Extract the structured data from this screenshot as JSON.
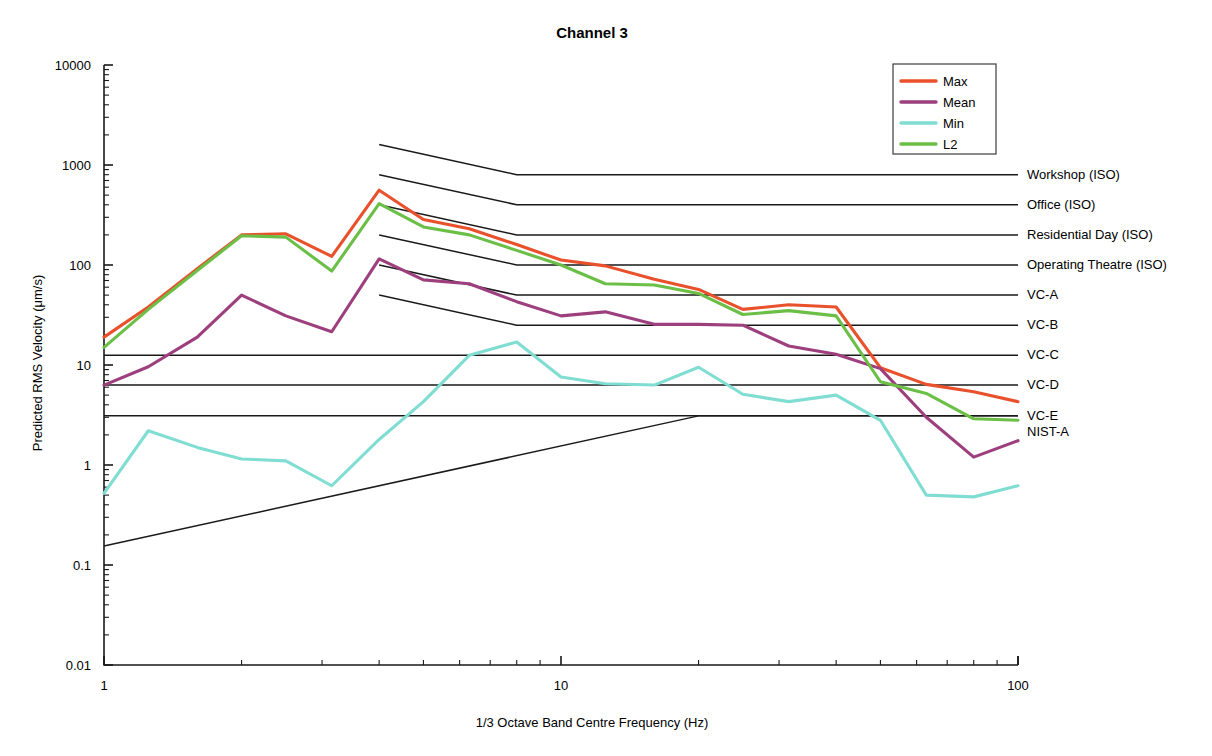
{
  "chart_data": {
    "type": "line",
    "title": "Channel 3",
    "xlabel": "1/3 Octave Band Centre Frequency (Hz)",
    "ylabel": "Predicted RMS Velocity (μm/s)",
    "xscale": "log",
    "yscale": "log",
    "xlim": [
      1,
      100
    ],
    "ylim": [
      0.01,
      10000
    ],
    "xticks": [
      1,
      10,
      100
    ],
    "xtick_labels": [
      "1",
      "10",
      "100"
    ],
    "yticks": [
      0.01,
      0.1,
      1,
      10,
      100,
      1000,
      10000
    ],
    "ytick_labels": [
      "0.01",
      "0.1",
      "1",
      "10",
      "100",
      "1000",
      "10000"
    ],
    "grid": false,
    "legend_position": "top-right",
    "x": [
      1.0,
      1.25,
      1.6,
      2.0,
      2.5,
      3.15,
      4.0,
      5.0,
      6.3,
      8.0,
      10.0,
      12.5,
      16.0,
      20.0,
      25.0,
      31.5,
      40.0,
      50.0,
      63.0,
      80.0,
      100.0
    ],
    "series": [
      {
        "name": "Max",
        "color": "#e8512c",
        "values": [
          19.0,
          38.0,
          92.0,
          200.0,
          205.0,
          122.0,
          560.0,
          285.0,
          230.0,
          160.0,
          112.0,
          98.0,
          72.0,
          57.0,
          36.0,
          40.0,
          38.0,
          9.4,
          6.4,
          5.4,
          4.3
        ]
      },
      {
        "name": "Mean",
        "color": "#9c3f7c",
        "values": [
          6.3,
          9.6,
          19.0,
          50.0,
          31.0,
          21.5,
          115.0,
          71.0,
          65.0,
          43.0,
          31.0,
          34.0,
          25.5,
          25.5,
          25.0,
          15.5,
          12.8,
          9.2,
          3.0,
          1.2,
          1.75
        ]
      },
      {
        "name": "Min",
        "color": "#80ddd2",
        "values": [
          0.52,
          2.2,
          1.5,
          1.15,
          1.1,
          0.62,
          1.8,
          4.3,
          12.5,
          17.0,
          7.6,
          6.5,
          6.3,
          9.5,
          5.1,
          4.3,
          5.0,
          2.8,
          0.5,
          0.48,
          0.62
        ]
      },
      {
        "name": "L2",
        "color": "#6bbf46",
        "values": [
          15.0,
          36.0,
          88.0,
          196.0,
          190.0,
          87.0,
          410.0,
          240.0,
          200.0,
          140.0,
          100.0,
          65.0,
          63.0,
          52.0,
          32.0,
          35.0,
          31.0,
          6.8,
          5.2,
          2.9,
          2.8
        ]
      }
    ],
    "criteria": [
      {
        "label": "Workshop (ISO)",
        "points": [
          [
            4,
            1600
          ],
          [
            8,
            800
          ],
          [
            100,
            800
          ]
        ]
      },
      {
        "label": "Office (ISO)",
        "points": [
          [
            4,
            800
          ],
          [
            8,
            400
          ],
          [
            100,
            400
          ]
        ]
      },
      {
        "label": "Residential Day (ISO)",
        "points": [
          [
            4,
            400
          ],
          [
            8,
            200
          ],
          [
            100,
            200
          ]
        ]
      },
      {
        "label": "Operating Theatre (ISO)",
        "points": [
          [
            4,
            200
          ],
          [
            8,
            100
          ],
          [
            100,
            100
          ]
        ]
      },
      {
        "label": "VC-A",
        "points": [
          [
            4,
            100
          ],
          [
            8,
            50
          ],
          [
            100,
            50
          ]
        ]
      },
      {
        "label": "VC-B",
        "points": [
          [
            4,
            50
          ],
          [
            8,
            25
          ],
          [
            100,
            25
          ]
        ]
      },
      {
        "label": "VC-C",
        "points": [
          [
            1,
            12.5
          ],
          [
            100,
            12.5
          ]
        ]
      },
      {
        "label": "VC-D",
        "points": [
          [
            1,
            6.3
          ],
          [
            100,
            6.3
          ]
        ]
      },
      {
        "label": "VC-E",
        "points": [
          [
            1,
            3.1
          ],
          [
            100,
            3.1
          ]
        ]
      },
      {
        "label": "NIST-A",
        "points": [
          [
            1,
            0.155
          ],
          [
            20,
            3.1
          ],
          [
            100,
            3.1
          ]
        ]
      }
    ]
  },
  "legend": {
    "entries": [
      {
        "label": "Max",
        "color": "#e8512c"
      },
      {
        "label": "Mean",
        "color": "#9c3f7c"
      },
      {
        "label": "Min",
        "color": "#80ddd2"
      },
      {
        "label": "L2",
        "color": "#6bbf46"
      }
    ]
  },
  "colors": {
    "axis": "#1a1a1a",
    "criterion_line": "#1a1a1a",
    "background": "#ffffff",
    "text": "#1a1a1a"
  }
}
